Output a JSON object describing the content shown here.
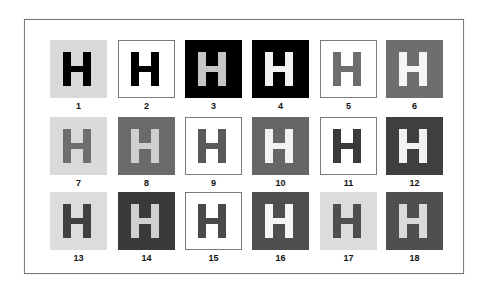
{
  "figure": {
    "frame_border_color": "#7a7a7a",
    "letter": "H",
    "tiles": [
      {
        "label": "1",
        "bg": "#d9d9d9",
        "fg": "#000000",
        "bordered": false
      },
      {
        "label": "2",
        "bg": "#ffffff",
        "fg": "#000000",
        "bordered": true
      },
      {
        "label": "3",
        "bg": "#000000",
        "fg": "#c6c6c6",
        "bordered": false
      },
      {
        "label": "4",
        "bg": "#000000",
        "fg": "#f2f2f2",
        "bordered": false
      },
      {
        "label": "5",
        "bg": "#ffffff",
        "fg": "#6e6e6e",
        "bordered": true
      },
      {
        "label": "6",
        "bg": "#6e6e6e",
        "fg": "#f5f5f5",
        "bordered": false
      },
      {
        "label": "7",
        "bg": "#dadada",
        "fg": "#6e6e6e",
        "bordered": false
      },
      {
        "label": "8",
        "bg": "#6a6a6a",
        "fg": "#cfcfcf",
        "bordered": false
      },
      {
        "label": "9",
        "bg": "#ffffff",
        "fg": "#5a5a5a",
        "bordered": true
      },
      {
        "label": "10",
        "bg": "#666666",
        "fg": "#f2f2f2",
        "bordered": false
      },
      {
        "label": "11",
        "bg": "#ffffff",
        "fg": "#3a3a3a",
        "bordered": true
      },
      {
        "label": "12",
        "bg": "#3f3f3f",
        "fg": "#f2f2f2",
        "bordered": false
      },
      {
        "label": "13",
        "bg": "#dcdcdc",
        "fg": "#404040",
        "bordered": false
      },
      {
        "label": "14",
        "bg": "#3a3a3a",
        "fg": "#d0d0d0",
        "bordered": false
      },
      {
        "label": "15",
        "bg": "#ffffff",
        "fg": "#4a4a4a",
        "bordered": true
      },
      {
        "label": "16",
        "bg": "#4e4e4e",
        "fg": "#f5f5f5",
        "bordered": false
      },
      {
        "label": "17",
        "bg": "#dcdcdc",
        "fg": "#4e4e4e",
        "bordered": false
      },
      {
        "label": "18",
        "bg": "#4f4f4f",
        "fg": "#dadada",
        "bordered": false
      }
    ]
  }
}
